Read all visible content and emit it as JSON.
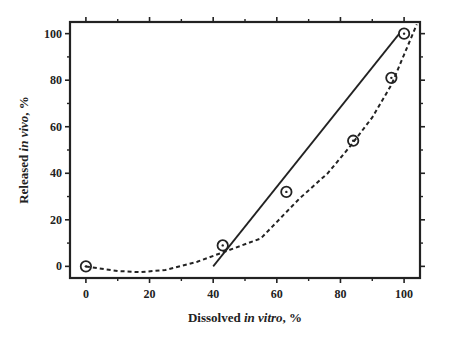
{
  "chart_data": {
    "type": "scatter",
    "title": "",
    "xlabel": {
      "pre": "Dissolved ",
      "italic": "in vitro",
      "post": ", %"
    },
    "ylabel": {
      "pre": "Released ",
      "italic": "in vivo",
      "post": ", %"
    },
    "xlim": [
      -5,
      105
    ],
    "ylim": [
      -5,
      105
    ],
    "xticks": [
      0,
      20,
      40,
      60,
      80,
      100
    ],
    "yticks": [
      0,
      20,
      40,
      60,
      80,
      100
    ],
    "grid": false,
    "legend": null,
    "series": [
      {
        "name": "observed",
        "kind": "points",
        "marker": "circle-dot",
        "x": [
          0,
          43,
          63,
          84,
          96,
          100
        ],
        "y": [
          0,
          9,
          32,
          54,
          81,
          100
        ]
      },
      {
        "name": "linear fit",
        "kind": "line",
        "style": "solid",
        "x": [
          40,
          98.5
        ],
        "y": [
          0,
          100
        ]
      },
      {
        "name": "polynomial fit",
        "kind": "line",
        "style": "dashed",
        "x": [
          0,
          10,
          17,
          25,
          35,
          45,
          55,
          67,
          76,
          83,
          90,
          96,
          100,
          104
        ],
        "y": [
          0,
          -2,
          -2.5,
          -1.5,
          2,
          7,
          12,
          29,
          40,
          51.5,
          64,
          78,
          91,
          104
        ]
      }
    ]
  }
}
